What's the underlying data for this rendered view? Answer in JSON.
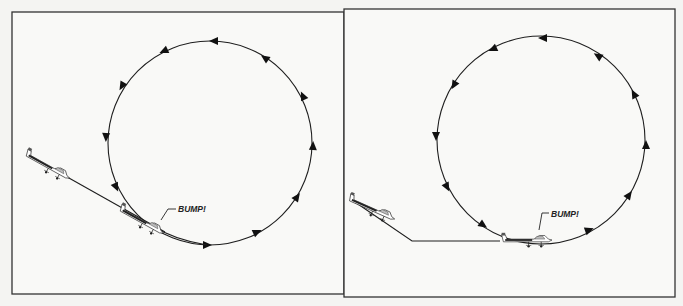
{
  "figure": {
    "panels": [
      {
        "id": "left",
        "frame": {
          "x": 12,
          "y": 12,
          "w": 332,
          "h": 282
        },
        "loop": {
          "cx": 210,
          "cy": 143,
          "r": 102
        },
        "callout": "BUMP!",
        "approach_path": "straight descending line intersecting loop bottom"
      },
      {
        "id": "right",
        "frame": {
          "x": 344,
          "y": 9,
          "w": 331,
          "h": 288
        },
        "loop": {
          "cx": 541,
          "cy": 140,
          "r": 104
        },
        "callout": "BUMP!",
        "approach_path": "descending line then level line tangent to loop bottom"
      }
    ],
    "colors": {
      "ink": "#1e1e1e",
      "paper": "#f4f4f2",
      "frame": "#333333"
    }
  }
}
